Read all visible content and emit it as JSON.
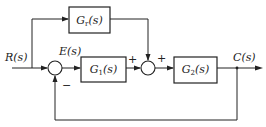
{
  "diagram": {
    "type": "block-diagram",
    "title": "",
    "signals": {
      "input": "R(s)",
      "error": "E(s)",
      "output": "C(s)"
    },
    "blocks": [
      {
        "id": "Gr",
        "label": "G",
        "sub": "r",
        "suffix": "(s)",
        "role": "feedforward"
      },
      {
        "id": "G1",
        "label": "G",
        "sub": "1",
        "suffix": "(s)",
        "role": "forward"
      },
      {
        "id": "G2",
        "label": "G",
        "sub": "2",
        "suffix": "(s)",
        "role": "plant"
      }
    ],
    "summing_junctions": [
      {
        "id": "S1",
        "signs": {
          "input": "+",
          "feedback": "−"
        },
        "visible_signs": [
          "−"
        ]
      },
      {
        "id": "S2",
        "signs": {
          "left": "+",
          "top": "+"
        },
        "visible_signs": [
          "+",
          "+"
        ]
      }
    ],
    "sign_labels": {
      "s1_feedback": "−",
      "s2_left": "+",
      "s2_top": "+"
    },
    "connections": [
      "R(s) -> S1(+)",
      "R(s) -> Gr",
      "S1 -> E(s) -> G1",
      "G1 -> S2(+)",
      "Gr -> S2(+)",
      "S2 -> G2",
      "G2 -> C(s)",
      "C(s) -> S1(−) (unity feedback)"
    ]
  }
}
